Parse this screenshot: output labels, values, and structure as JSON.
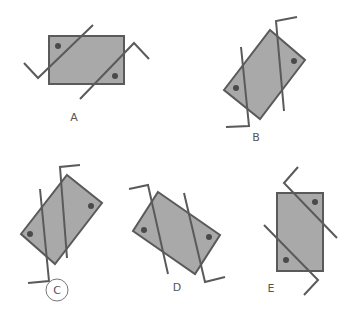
{
  "colors": {
    "fill": "#a9a9a9",
    "stroke": "#5a5a5a",
    "dot": "#4a4a4a",
    "label": "#555555"
  },
  "figures": [
    {
      "id": "A",
      "label": "A",
      "circled": false
    },
    {
      "id": "B",
      "label": "B",
      "circled": false
    },
    {
      "id": "C",
      "label": "C",
      "circled": true
    },
    {
      "id": "D",
      "label": "D",
      "circled": false
    },
    {
      "id": "E",
      "label": "E",
      "circled": false
    }
  ]
}
